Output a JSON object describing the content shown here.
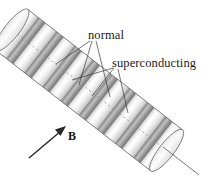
{
  "figure": {
    "background_color": "#ffffff",
    "labels": {
      "normal": "normal",
      "superconducting": "superconducting",
      "field": "B"
    },
    "colors": {
      "normal_band": "#9a9a9a",
      "normal_band_dark": "#8a8a8a",
      "superconducting_band": "#f2f2f2",
      "superconducting_band_shadow": "#d8d8d8",
      "outline": "#6d6d6d",
      "leader": "#3a3a3a",
      "axis": "#8d8d8d",
      "arrow": "#2a2a2a",
      "text": "#1a1a1a",
      "endcap_fill": "#fbfbfb"
    },
    "cylinder": {
      "orientation": "tilted, upper-left to lower-right",
      "axis_angle_degrees": 41,
      "radius_px": 26,
      "length_px": 170,
      "band_count": 16,
      "normal_band_count": 8,
      "superconducting_band_count": 8,
      "axis_start": [
        12,
        30
      ],
      "axis_end": [
        196,
        173
      ],
      "dashed_centerline": true
    },
    "field_arrow": {
      "label": "B",
      "tail": [
        30,
        158
      ],
      "tip": [
        66,
        127
      ],
      "direction": "up-right",
      "label_position": [
        69,
        137
      ]
    },
    "leaders": {
      "normal": {
        "anchor": [
          90,
          38
        ],
        "target_count": 3,
        "targets_description": "three dark normal bands on the cylinder"
      },
      "superconducting": {
        "anchor": [
          120,
          66
        ],
        "target_count": 3,
        "targets_description": "three light superconducting bands on the cylinder"
      }
    }
  }
}
